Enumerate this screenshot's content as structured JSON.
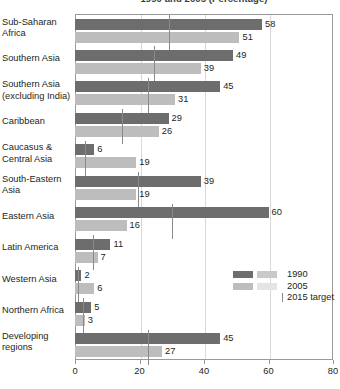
{
  "chart_data": {
    "type": "bar",
    "orientation": "horizontal",
    "title": "1990 and 2005 (Percentage)",
    "xlabel": "",
    "ylabel": "",
    "xlim": [
      0,
      80
    ],
    "xticks": [
      0,
      20,
      40,
      60,
      80
    ],
    "grid": true,
    "gridlines_at": [
      20,
      40,
      60
    ],
    "legend_position": "inside-bottom-right",
    "categories": [
      "Sub-Saharan Africa",
      "Southern Asia",
      "Southern Asia (excluding India)",
      "Caribbean",
      "Caucasus & Central Asia",
      "South-Eastern Asia",
      "Eastern Asia",
      "Latin America",
      "Western Asia",
      "Northern Africa",
      "Developing regions"
    ],
    "series": [
      {
        "name": "1990",
        "color": "#6d6d6d",
        "values": [
          58,
          49,
          45,
          29,
          6,
          39,
          60,
          11,
          2,
          5,
          45
        ]
      },
      {
        "name": "2005",
        "color": "#bdbdbd",
        "values": [
          51,
          39,
          31,
          26,
          19,
          19,
          16,
          7,
          6,
          3,
          27
        ]
      },
      {
        "name": "2015 target",
        "color": "#8a8a8a",
        "marker": "vertical-tick",
        "values": [
          29,
          24.5,
          22.5,
          14.5,
          3,
          19.5,
          30,
          5.5,
          1,
          2.5,
          22.5
        ]
      }
    ],
    "legend": [
      {
        "label": "1990",
        "swatch_left": "#6d6d6d",
        "swatch_right": "#c9c9c9"
      },
      {
        "label": "2005",
        "swatch_left": "#bdbdbd",
        "swatch_right": "#e4e4e4"
      },
      {
        "label": "2015 target",
        "marker": "vertical-tick"
      }
    ]
  },
  "axis": {
    "tick_labels": [
      "0",
      "20",
      "40",
      "60",
      "80"
    ]
  },
  "rows": [
    {
      "label_line1": "Sub-Saharan",
      "label_line2": "Africa",
      "v1990": "58",
      "v2005": "51"
    },
    {
      "label_line1": "Southern Asia",
      "label_line2": "",
      "v1990": "49",
      "v2005": "39"
    },
    {
      "label_line1": "Southern Asia",
      "label_line2": "(excluding India)",
      "v1990": "45",
      "v2005": "31"
    },
    {
      "label_line1": "Caribbean",
      "label_line2": "",
      "v1990": "29",
      "v2005": "26"
    },
    {
      "label_line1": "Caucasus &",
      "label_line2": "Central Asia",
      "v1990": "6",
      "v2005": "19"
    },
    {
      "label_line1": "South-Eastern",
      "label_line2": "Asia",
      "v1990": "39",
      "v2005": "19"
    },
    {
      "label_line1": "Eastern Asia",
      "label_line2": "",
      "v1990": "60",
      "v2005": "16"
    },
    {
      "label_line1": "Latin America",
      "label_line2": "",
      "v1990": "11",
      "v2005": "7"
    },
    {
      "label_line1": "Western Asia",
      "label_line2": "",
      "v1990": "2",
      "v2005": "6"
    },
    {
      "label_line1": "Northern Africa",
      "label_line2": "",
      "v1990": "5",
      "v2005": "3"
    },
    {
      "label_line1": "Developing",
      "label_line2": "regions",
      "v1990": "45",
      "v2005": "27"
    }
  ],
  "legend_labels": {
    "l1990": "1990",
    "l2005": "2005",
    "l2015": "2015 target"
  }
}
